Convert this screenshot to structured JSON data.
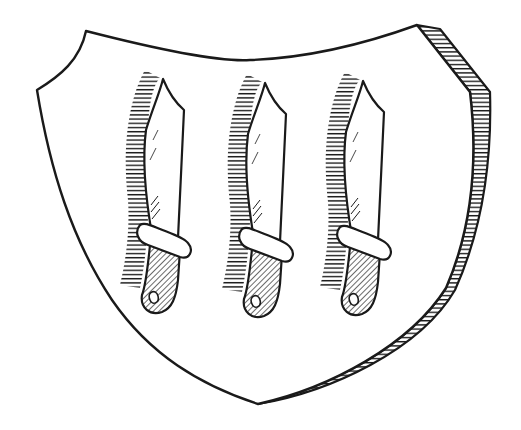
{
  "figure": {
    "background_color": "#ffffff",
    "ink_color": "#1a1a1a"
  },
  "shield": {
    "shape": "heater shield, slightly turned showing right-side thickness",
    "field": "argent (plain white)",
    "edge_hatching": "horizontal / diagonal hatch on right bevelled edge"
  },
  "charges": {
    "count": 3,
    "type": "knife (seax) paleways, point up",
    "items": [
      {
        "label": "knife-1",
        "x": 160
      },
      {
        "label": "knife-2",
        "x": 262
      },
      {
        "label": "knife-3",
        "x": 362
      }
    ],
    "blade": "white with fine diagonal detail lines",
    "guard": "white rounded band wrapped diagonally",
    "grip": "diagonally hatched, ending in a curled pommel",
    "shadow": "horizontal hatched shading to the left of each knife"
  }
}
